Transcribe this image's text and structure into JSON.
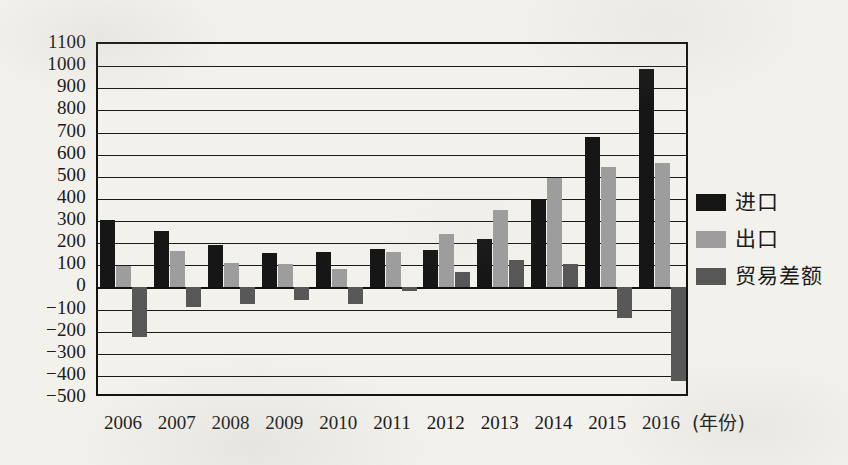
{
  "chart_data": {
    "type": "bar",
    "title": "",
    "xlabel": "(年份)",
    "ylabel": "",
    "grid": true,
    "legend_position": "right",
    "ylim": [
      -500,
      1100
    ],
    "ytick_step": 100,
    "yticks": [
      "1100",
      "1000",
      "900",
      "800",
      "700",
      "600",
      "500",
      "400",
      "300",
      "200",
      "100",
      "0",
      "−100",
      "−200",
      "−300",
      "−400",
      "−500"
    ],
    "categories": [
      "2006",
      "2007",
      "2008",
      "2009",
      "2010",
      "2011",
      "2012",
      "2013",
      "2014",
      "2015",
      "2016"
    ],
    "series": [
      {
        "name": "进口",
        "color": "#161616",
        "values": [
          305,
          255,
          190,
          155,
          160,
          175,
          170,
          220,
          400,
          680,
          985
        ]
      },
      {
        "name": "出口",
        "color": "#9d9d9d",
        "values": [
          95,
          165,
          110,
          105,
          85,
          160,
          240,
          350,
          495,
          545,
          560
        ]
      },
      {
        "name": "贸易差额",
        "color": "#575757",
        "values": [
          -225,
          -90,
          -75,
          -55,
          -75,
          -15,
          70,
          125,
          105,
          -140,
          -425
        ]
      }
    ]
  },
  "axis": {
    "x_unit_label": "(年份)"
  },
  "legend": {
    "items": [
      {
        "label": "进口",
        "color": "#161616"
      },
      {
        "label": "出口",
        "color": "#9d9d9d"
      },
      {
        "label": "贸易差额",
        "color": "#575757"
      }
    ]
  }
}
